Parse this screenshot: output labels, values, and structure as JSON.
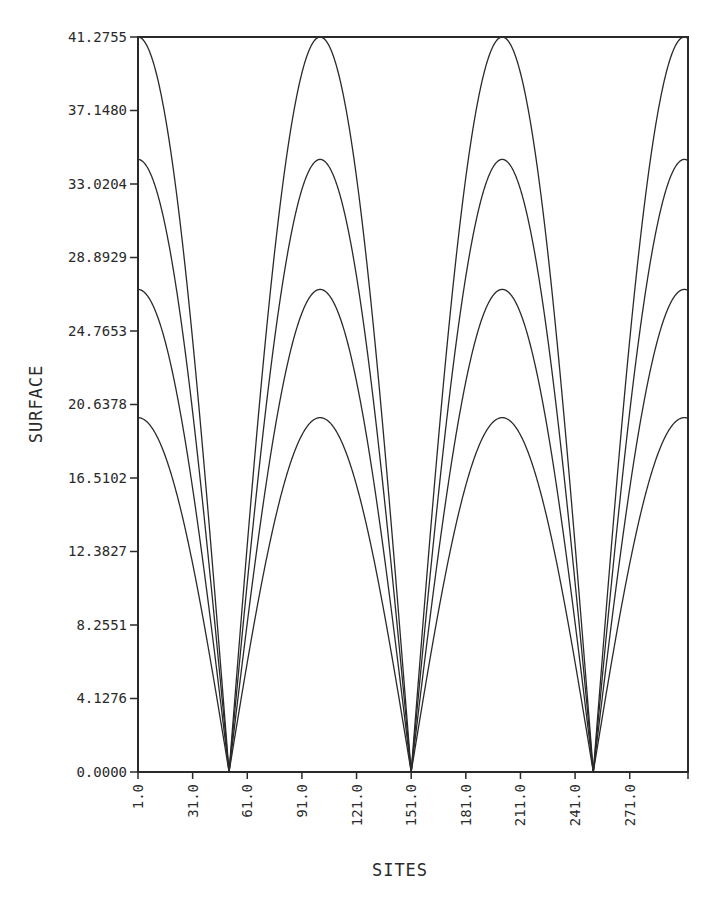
{
  "chart_data": {
    "type": "line",
    "title": "",
    "xlabel": "SITES",
    "ylabel": "SURFACE",
    "xlim": [
      1,
      303
    ],
    "ylim": [
      0,
      41.2755
    ],
    "grid": false,
    "legend": null,
    "x_ticks": [
      "1.0",
      "31.0",
      "61.0",
      "91.0",
      "121.0",
      "151.0",
      "181.0",
      "211.0",
      "241.0",
      "271.0"
    ],
    "x_tick_values": [
      1,
      31,
      61,
      91,
      121,
      151,
      181,
      211,
      241,
      271
    ],
    "y_ticks": [
      "0.0000",
      "4.1276",
      "8.2551",
      "12.3827",
      "16.5102",
      "20.6378",
      "24.7653",
      "28.8929",
      "33.0204",
      "37.1480",
      "41.2755"
    ],
    "y_tick_values": [
      0,
      4.1276,
      8.2551,
      12.3827,
      16.5102,
      20.6378,
      24.7653,
      28.8929,
      33.0204,
      37.148,
      41.2755
    ],
    "curve_model": "value = amplitude * |cos(pi * (site - 1) / period)|",
    "period": 100,
    "peaks_at_sites": [
      1,
      101,
      201,
      301
    ],
    "minima_at_sites": [
      51,
      151,
      251
    ],
    "series": [
      {
        "name": "curve-1",
        "amplitude": 41.2755
      },
      {
        "name": "curve-2",
        "amplitude": 34.4
      },
      {
        "name": "curve-3",
        "amplitude": 27.1
      },
      {
        "name": "curve-4",
        "amplitude": 19.9
      }
    ]
  },
  "colors": {
    "line": "#2a2a2a",
    "background": "#ffffff"
  }
}
